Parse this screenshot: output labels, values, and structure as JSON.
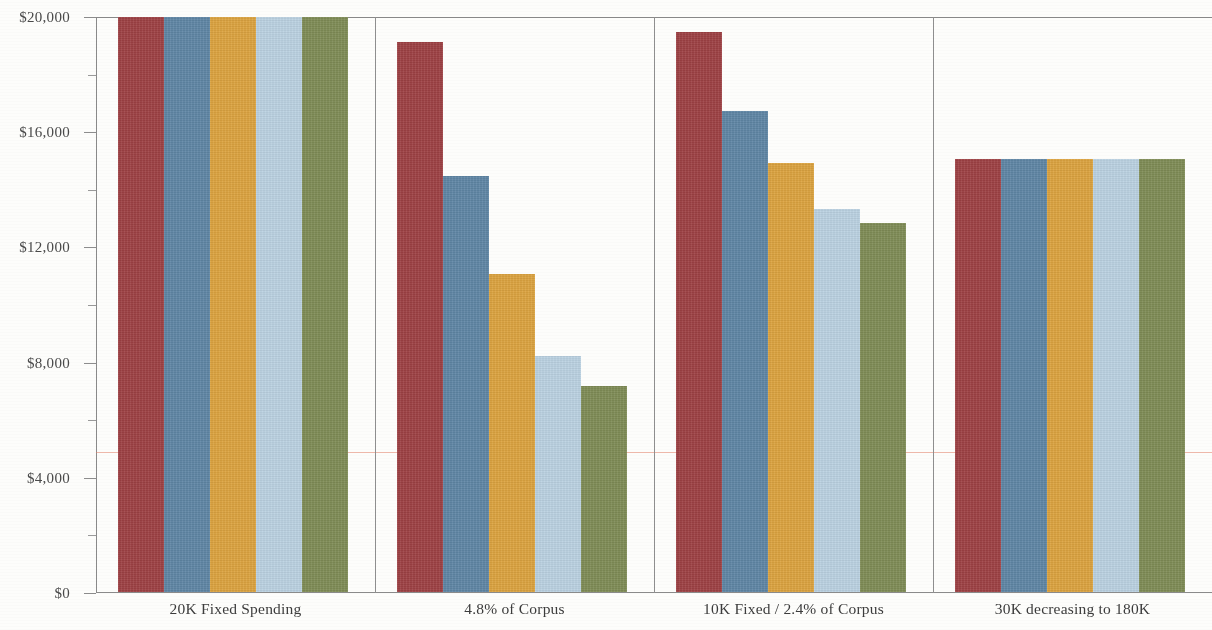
{
  "chart_data": {
    "type": "bar",
    "title": "",
    "xlabel": "",
    "ylabel": "",
    "ylim": [
      0,
      20000
    ],
    "grid": false,
    "legend": "none",
    "y_axis": {
      "major_ticks": [
        0,
        4000,
        8000,
        12000,
        16000,
        20000
      ],
      "major_tick_labels": [
        "$0",
        "$4,000",
        "$8,000",
        "$12,000",
        "$16,000",
        "$20,000"
      ],
      "minor_ticks": [
        2000,
        6000,
        10000,
        14000,
        18000
      ],
      "tick_format": "$#,##0"
    },
    "categories": [
      "20K Fixed Spending",
      "4.8% of Corpus",
      "10K Fixed / 2.4% of Corpus",
      "30K decreasing to 180K"
    ],
    "series": [
      {
        "name": "series-1",
        "color": "#9e4144",
        "values": [
          20000,
          19100,
          19450,
          15050
        ]
      },
      {
        "name": "series-2",
        "color": "#5f86a5",
        "values": [
          20000,
          14450,
          16700,
          15050
        ]
      },
      {
        "name": "series-3",
        "color": "#dca33f",
        "values": [
          20000,
          11050,
          14900,
          15050
        ]
      },
      {
        "name": "series-4",
        "color": "#bbd2e2",
        "values": [
          20000,
          8200,
          13300,
          15050
        ]
      },
      {
        "name": "series-5",
        "color": "#7f8c56",
        "values": [
          20000,
          7150,
          12800,
          15050
        ]
      }
    ],
    "annotations": [
      {
        "name": "reference-line",
        "type": "hline",
        "value": 4900,
        "color": "#e8836b"
      }
    ],
    "clipped_note": "Group 1 bars are clipped at the top of the $20,000 axis."
  }
}
